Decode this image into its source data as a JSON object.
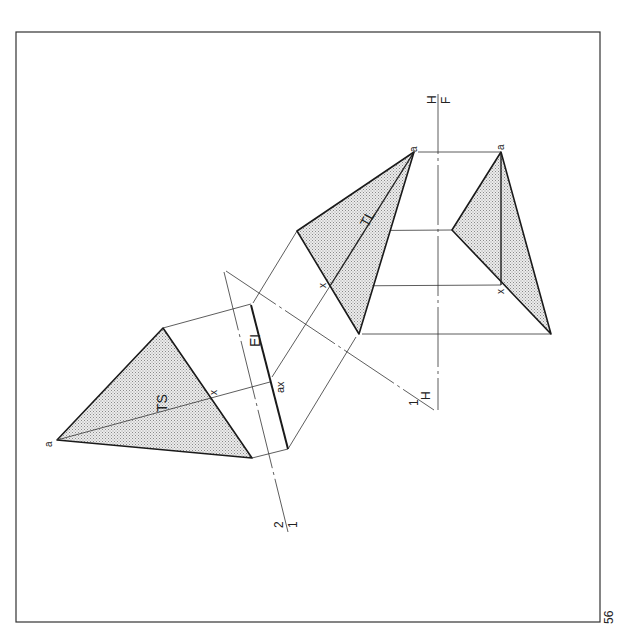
{
  "page": {
    "page_number": "56"
  },
  "labels": {
    "ts_apex": "a",
    "ts_label": "TS",
    "ts_x": "x",
    "edge_label": "EI",
    "edge_point": "ax",
    "tl_label": "TL",
    "mid_apex": "a",
    "mid_x": "x",
    "right_apex": "a",
    "right_x": "x",
    "ref_21_top": "2",
    "ref_21_bottom": "1",
    "ref_1h_left": "1",
    "ref_1h_right": "H",
    "ref_hf_top": "H",
    "ref_hf_bottom": "F"
  },
  "colors": {
    "line": "#1a1a1a",
    "shade": "#d9d9d9",
    "background": "#ffffff"
  }
}
